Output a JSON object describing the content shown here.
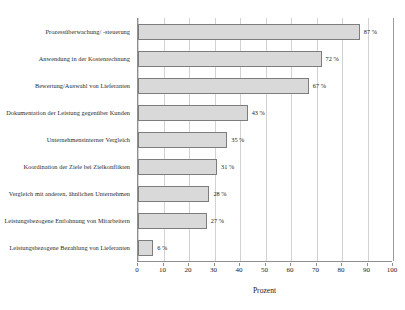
{
  "chart_data": {
    "type": "bar",
    "orientation": "horizontal",
    "title": "",
    "xlabel": "Prozent",
    "ylabel": "",
    "xlim": [
      0,
      100
    ],
    "xticks": [
      "0",
      "10",
      "20",
      "30",
      "40",
      "50",
      "60",
      "70",
      "80",
      "90",
      "100"
    ],
    "grid": true,
    "legend": "none",
    "value_suffix": "%",
    "categories": [
      "Prozessüberwachung/ -steuerung",
      "Anwendung in der Kostenrechnung",
      "Bewertung/Auswahl von Lieferanten",
      "Dokumentation der Leistung gegenüber Kunden",
      "Unternehmensinterner Vergleich",
      "Koordination der Ziele bei Zielkonflikten",
      "Vergleich mit anderen, ähnlichen Unternehmen",
      "Leistungsbezogene Entlohnung von Mitarbeitern",
      "Leistungsbezogene Bezahlung von Lieferanten"
    ],
    "values": [
      87,
      72,
      67,
      43,
      35,
      31,
      28,
      27,
      6
    ],
    "value_labels": [
      "87 %",
      "72 %",
      "67 %",
      "43 %",
      "35 %",
      "31 %",
      "28 %",
      "27 %",
      "6 %"
    ],
    "colors": {
      "bar_fill": "#d9d9d9",
      "bar_border": "#7d7d7d",
      "gridline": "#d2d2d2",
      "axis": "#8f8f8f",
      "text": "#1a1a1a",
      "background": "#ffffff"
    }
  }
}
